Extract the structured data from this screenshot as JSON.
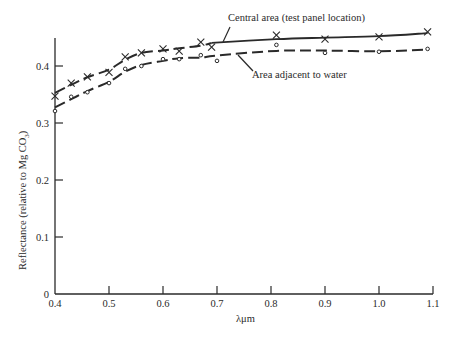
{
  "chart_data": {
    "type": "line",
    "title": "",
    "xlabel": "λμm",
    "ylabel": "Reflectance (relative to Mg CO₃)",
    "xlim": [
      0.4,
      1.1
    ],
    "ylim": [
      0,
      0.45
    ],
    "xticks": [
      "0.4",
      "0.5",
      "0.6",
      "0.7",
      "0.8",
      "0.9",
      "1.0",
      "1.1"
    ],
    "yticks": [
      "0",
      "0.1",
      "0.2",
      "0.3",
      "0.4"
    ],
    "grid": false,
    "legend": "inline annotations",
    "series": [
      {
        "name": "Central area (test panel location)",
        "marker": "x",
        "line_style": "long-dash then solid",
        "x": [
          0.4,
          0.43,
          0.46,
          0.5,
          0.53,
          0.56,
          0.6,
          0.63,
          0.67,
          0.69,
          0.81,
          0.9,
          1.0,
          1.09
        ],
        "y": [
          0.347,
          0.37,
          0.381,
          0.389,
          0.416,
          0.423,
          0.43,
          0.426,
          0.442,
          0.433,
          0.454,
          0.447,
          0.451,
          0.46
        ]
      },
      {
        "name": "Area adjacent to water",
        "marker": "o",
        "line_style": "dashed",
        "x": [
          0.4,
          0.43,
          0.46,
          0.5,
          0.53,
          0.56,
          0.6,
          0.63,
          0.67,
          0.7,
          0.81,
          0.9,
          1.0,
          1.09
        ],
        "y": [
          0.321,
          0.346,
          0.354,
          0.37,
          0.395,
          0.4,
          0.412,
          0.412,
          0.419,
          0.409,
          0.437,
          0.423,
          0.425,
          0.43
        ]
      }
    ],
    "annotations": [
      {
        "text": "Central area (test panel location)",
        "points_to_series": 0
      },
      {
        "text": "Area adjacent to water",
        "points_to_series": 1
      }
    ]
  },
  "labels": {
    "xlabel": "λμm",
    "ylabel_main": "Reflectance (relative to Mg CO",
    "ylabel_sub": "3",
    "ylabel_end": ")",
    "annot_central": "Central area (test panel location)",
    "annot_adjacent": "Area adjacent to water"
  },
  "colors": {
    "ink": "#2a2a2a",
    "background": "#ffffff"
  }
}
